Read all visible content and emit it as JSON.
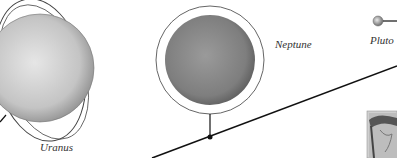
{
  "diagram": {
    "planets": [
      {
        "name": "Uranus",
        "label": "Uranus",
        "color": "#c9c9c9"
      },
      {
        "name": "Neptune",
        "label": "Neptune",
        "color": "#8a8a8a"
      },
      {
        "name": "Pluto",
        "label": "Pluto",
        "color": "#9a9a9a"
      }
    ],
    "colors": {
      "line": "#111111",
      "ring": "#555555",
      "background": "#ffffff"
    }
  }
}
